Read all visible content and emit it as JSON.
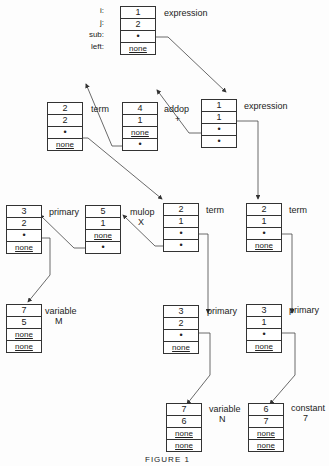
{
  "field_labels": [
    "i:",
    "j:",
    "sub:",
    "left:"
  ],
  "nodes": {
    "root": {
      "cells": [
        "1",
        "2",
        "•",
        "none"
      ],
      "label": "expression"
    },
    "expr": {
      "cells": [
        "1",
        "1",
        "•",
        "•"
      ],
      "label": "expression"
    },
    "addop": {
      "cells": [
        "4",
        "1",
        "none",
        "•"
      ],
      "label": "addop",
      "sub": "+"
    },
    "term_a": {
      "cells": [
        "2",
        "2",
        "•",
        "none"
      ],
      "label": "term"
    },
    "term_b": {
      "cells": [
        "2",
        "1",
        "•",
        "•"
      ],
      "label": "term"
    },
    "term_c": {
      "cells": [
        "2",
        "1",
        "•",
        "none"
      ],
      "label": "term"
    },
    "mulop": {
      "cells": [
        "5",
        "1",
        "none",
        "•"
      ],
      "label": "mulop",
      "sub": "X"
    },
    "prim_a": {
      "cells": [
        "3",
        "2",
        "•",
        "none"
      ],
      "label": "primary"
    },
    "prim_b": {
      "cells": [
        "3",
        "2",
        "•",
        "none"
      ],
      "label": "primary"
    },
    "prim_c": {
      "cells": [
        "3",
        "1",
        "•",
        "none"
      ],
      "label": "primary"
    },
    "var_m": {
      "cells": [
        "7",
        "5",
        "none",
        "none"
      ],
      "label": "variable",
      "sub": "M"
    },
    "var_n": {
      "cells": [
        "7",
        "6",
        "none",
        "none"
      ],
      "label": "variable",
      "sub": "N"
    },
    "const_7": {
      "cells": [
        "6",
        "7",
        "none",
        "none"
      ],
      "label": "constant",
      "sub": "7"
    }
  },
  "caption": "FIGURE 1"
}
